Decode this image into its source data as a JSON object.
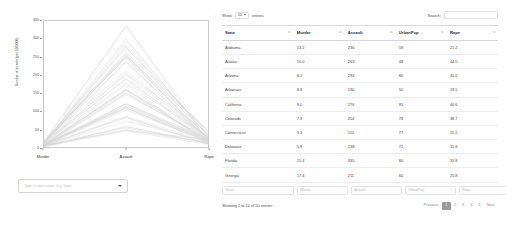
{
  "plot": {
    "ylabel": "Number of arrests (per 100,000)",
    "yticks": [
      "350",
      "300",
      "250",
      "200",
      "150",
      "100",
      "50",
      "0"
    ],
    "ytick_values": [
      350,
      300,
      250,
      200,
      150,
      100,
      50,
      0
    ],
    "xticks": [
      "Murder",
      "Assault",
      "Rape"
    ],
    "ymin": 0,
    "ymax": 350,
    "line_color": "#d9d9d9",
    "axis_color": "#c9c9c9"
  },
  "state_select": {
    "placeholder": "Type a state name, e.g. Iowa",
    "value": ""
  },
  "datatable": {
    "length_label_before": "Show",
    "length_value": "10",
    "length_label_after": "entries",
    "length_options": [
      "10",
      "25",
      "50",
      "100"
    ],
    "search_label": "Search:",
    "search_value": "",
    "columns": [
      "State",
      "Murder",
      "Assault",
      "UrbanPop",
      "Rape"
    ],
    "rows": [
      [
        "Alabama",
        "13.2",
        "236",
        "58",
        "21.2"
      ],
      [
        "Alaska",
        "10.0",
        "263",
        "48",
        "44.5"
      ],
      [
        "Arizona",
        "8.1",
        "294",
        "80",
        "31.0"
      ],
      [
        "Arkansas",
        "8.8",
        "190",
        "50",
        "19.5"
      ],
      [
        "California",
        "9.0",
        "276",
        "91",
        "40.6"
      ],
      [
        "Colorado",
        "7.9",
        "204",
        "78",
        "38.7"
      ],
      [
        "Connecticut",
        "3.3",
        "110",
        "77",
        "11.1"
      ],
      [
        "Delaware",
        "5.9",
        "238",
        "72",
        "15.8"
      ],
      [
        "Florida",
        "15.4",
        "335",
        "80",
        "31.9"
      ],
      [
        "Georgia",
        "17.4",
        "211",
        "60",
        "25.8"
      ]
    ],
    "filter_placeholders": [
      "State",
      "Murder",
      "Assault",
      "UrbanPop",
      "Rape"
    ],
    "info": "Showing 1 to 10 of 50 entries",
    "pager": {
      "previous": "Previous",
      "pages": [
        "1",
        "2",
        "3",
        "4",
        "5"
      ],
      "active": "1",
      "next": "Next",
      "active_bg": "#9b9b9b"
    }
  },
  "chart_data": {
    "type": "line",
    "title": "",
    "xlabel": "",
    "ylabel": "Number of arrests (per 100,000)",
    "categories": [
      "Murder",
      "Assault",
      "Rape"
    ],
    "ylim": [
      0,
      350
    ],
    "grid": false,
    "legend": "none",
    "series": [
      {
        "name": "Alabama",
        "values": [
          13.2,
          236,
          21.2
        ]
      },
      {
        "name": "Alaska",
        "values": [
          10.0,
          263,
          44.5
        ]
      },
      {
        "name": "Arizona",
        "values": [
          8.1,
          294,
          31.0
        ]
      },
      {
        "name": "Arkansas",
        "values": [
          8.8,
          190,
          19.5
        ]
      },
      {
        "name": "California",
        "values": [
          9.0,
          276,
          40.6
        ]
      },
      {
        "name": "Colorado",
        "values": [
          7.9,
          204,
          38.7
        ]
      },
      {
        "name": "Connecticut",
        "values": [
          3.3,
          110,
          11.1
        ]
      },
      {
        "name": "Delaware",
        "values": [
          5.9,
          238,
          15.8
        ]
      },
      {
        "name": "Florida",
        "values": [
          15.4,
          335,
          31.9
        ]
      },
      {
        "name": "Georgia",
        "values": [
          17.4,
          211,
          25.8
        ]
      },
      {
        "name": "Hawaii",
        "values": [
          5.3,
          46,
          20.2
        ]
      },
      {
        "name": "Idaho",
        "values": [
          2.6,
          120,
          14.2
        ]
      },
      {
        "name": "Illinois",
        "values": [
          10.4,
          249,
          24.0
        ]
      },
      {
        "name": "Indiana",
        "values": [
          7.2,
          113,
          21.0
        ]
      },
      {
        "name": "Iowa",
        "values": [
          2.2,
          56,
          11.3
        ]
      },
      {
        "name": "Kansas",
        "values": [
          6.0,
          115,
          18.0
        ]
      },
      {
        "name": "Kentucky",
        "values": [
          9.7,
          109,
          16.3
        ]
      },
      {
        "name": "Louisiana",
        "values": [
          15.4,
          249,
          22.2
        ]
      },
      {
        "name": "Maine",
        "values": [
          2.1,
          83,
          7.8
        ]
      },
      {
        "name": "Maryland",
        "values": [
          11.3,
          300,
          27.8
        ]
      },
      {
        "name": "Massachusetts",
        "values": [
          4.4,
          149,
          16.3
        ]
      },
      {
        "name": "Michigan",
        "values": [
          12.1,
          255,
          35.1
        ]
      },
      {
        "name": "Minnesota",
        "values": [
          2.7,
          72,
          14.9
        ]
      },
      {
        "name": "Mississippi",
        "values": [
          16.1,
          259,
          17.1
        ]
      },
      {
        "name": "Missouri",
        "values": [
          9.0,
          178,
          28.2
        ]
      },
      {
        "name": "Montana",
        "values": [
          6.0,
          109,
          16.4
        ]
      },
      {
        "name": "Nebraska",
        "values": [
          4.3,
          102,
          16.5
        ]
      },
      {
        "name": "Nevada",
        "values": [
          12.2,
          252,
          46.0
        ]
      },
      {
        "name": "New Hampshire",
        "values": [
          2.1,
          57,
          9.5
        ]
      },
      {
        "name": "New Jersey",
        "values": [
          7.4,
          159,
          18.8
        ]
      },
      {
        "name": "New Mexico",
        "values": [
          11.4,
          285,
          32.1
        ]
      },
      {
        "name": "New York",
        "values": [
          11.1,
          254,
          26.1
        ]
      },
      {
        "name": "North Carolina",
        "values": [
          13.0,
          337,
          16.1
        ]
      },
      {
        "name": "North Dakota",
        "values": [
          0.8,
          45,
          7.3
        ]
      },
      {
        "name": "Ohio",
        "values": [
          7.3,
          120,
          21.4
        ]
      },
      {
        "name": "Oklahoma",
        "values": [
          6.6,
          151,
          20.0
        ]
      },
      {
        "name": "Oregon",
        "values": [
          4.9,
          159,
          29.3
        ]
      },
      {
        "name": "Pennsylvania",
        "values": [
          6.3,
          106,
          14.9
        ]
      },
      {
        "name": "Rhode Island",
        "values": [
          3.4,
          174,
          8.3
        ]
      },
      {
        "name": "South Carolina",
        "values": [
          14.4,
          279,
          22.5
        ]
      },
      {
        "name": "South Dakota",
        "values": [
          3.8,
          86,
          12.8
        ]
      },
      {
        "name": "Tennessee",
        "values": [
          13.2,
          188,
          26.9
        ]
      },
      {
        "name": "Texas",
        "values": [
          12.7,
          201,
          25.5
        ]
      },
      {
        "name": "Utah",
        "values": [
          3.2,
          120,
          22.9
        ]
      },
      {
        "name": "Vermont",
        "values": [
          2.2,
          48,
          11.2
        ]
      },
      {
        "name": "Virginia",
        "values": [
          8.5,
          156,
          20.7
        ]
      },
      {
        "name": "Washington",
        "values": [
          4.0,
          145,
          26.2
        ]
      },
      {
        "name": "West Virginia",
        "values": [
          5.7,
          81,
          9.3
        ]
      },
      {
        "name": "Wisconsin",
        "values": [
          2.6,
          53,
          10.8
        ]
      },
      {
        "name": "Wyoming",
        "values": [
          6.8,
          161,
          15.6
        ]
      }
    ]
  }
}
